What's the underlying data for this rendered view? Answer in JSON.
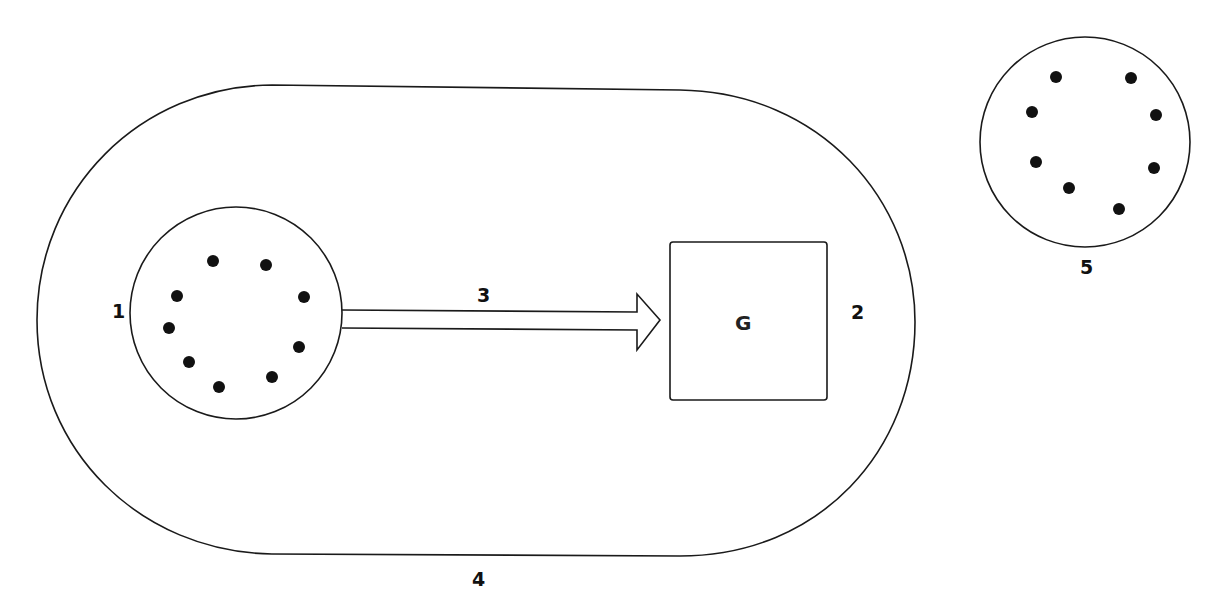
{
  "diagram": {
    "labels": {
      "circle_left": "1",
      "box": "2",
      "arrow": "3",
      "outer_boundary": "4",
      "circle_right": "5",
      "box_inner": "G"
    },
    "colors": {
      "stroke": "#1a1a1a",
      "dot": "#111111",
      "background": "#ffffff"
    },
    "circle_left": {
      "dot_count": 9
    },
    "circle_right": {
      "dot_count": 8
    }
  }
}
